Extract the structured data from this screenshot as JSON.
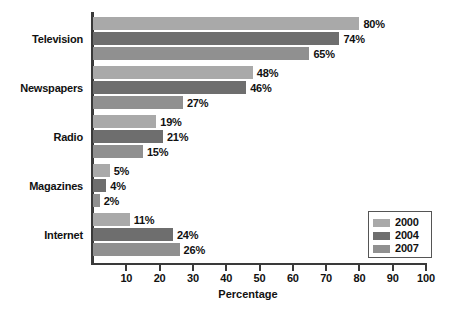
{
  "chart_data": {
    "type": "bar",
    "orientation": "horizontal",
    "title": "",
    "xlabel": "Percentage",
    "ylabel": "",
    "xlim": [
      0,
      100
    ],
    "xticks": [
      0,
      10,
      20,
      30,
      40,
      50,
      60,
      70,
      80,
      90,
      100
    ],
    "xtick_labels": [
      "",
      "10",
      "20",
      "30",
      "40",
      "50",
      "60",
      "70",
      "80",
      "90",
      "100"
    ],
    "grid": false,
    "legend_position": "lower-right",
    "value_label_suffix": "%",
    "categories": [
      "Television",
      "Newspapers",
      "Radio",
      "Magazines",
      "Internet"
    ],
    "series": [
      {
        "name": "2000",
        "color": "#a9a9a9",
        "values": [
          80,
          48,
          19,
          5,
          11
        ],
        "labels": [
          "80%",
          "48%",
          "19%",
          "5%",
          "11%"
        ]
      },
      {
        "name": "2004",
        "color": "#6e6e6e",
        "values": [
          74,
          46,
          21,
          4,
          24
        ],
        "labels": [
          "74%",
          "46%",
          "21%",
          "4%",
          "24%"
        ]
      },
      {
        "name": "2007",
        "color": "#909090",
        "values": [
          65,
          27,
          15,
          2,
          26
        ],
        "labels": [
          "65%",
          "27%",
          "15%",
          "2%",
          "26%"
        ]
      }
    ]
  },
  "axis": {
    "x_title": "Percentage",
    "ticks": [
      {
        "value": 10,
        "label": "10"
      },
      {
        "value": 20,
        "label": "20"
      },
      {
        "value": 30,
        "label": "30"
      },
      {
        "value": 40,
        "label": "40"
      },
      {
        "value": 50,
        "label": "50"
      },
      {
        "value": 60,
        "label": "60"
      },
      {
        "value": 70,
        "label": "70"
      },
      {
        "value": 80,
        "label": "80"
      },
      {
        "value": 90,
        "label": "90"
      },
      {
        "value": 100,
        "label": "100"
      }
    ]
  },
  "legend": {
    "entries": [
      {
        "label": "2000",
        "color": "#a9a9a9"
      },
      {
        "label": "2004",
        "color": "#6e6e6e"
      },
      {
        "label": "2007",
        "color": "#909090"
      }
    ]
  }
}
